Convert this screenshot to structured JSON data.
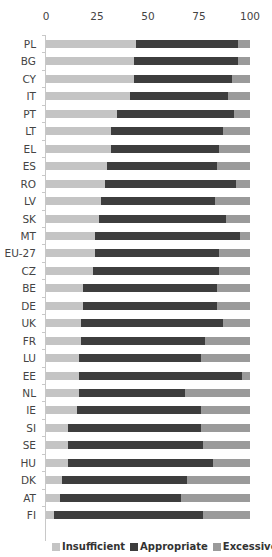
{
  "chart_data": {
    "type": "bar",
    "orientation": "horizontal",
    "stacked": true,
    "percent_stacked": true,
    "title": "",
    "xlabel": "",
    "ylabel": "",
    "xlim": [
      0,
      100
    ],
    "x_ticks": [
      "0",
      "25",
      "50",
      "75",
      "100"
    ],
    "x_axis_position": "top",
    "grid": false,
    "legend_position": "bottom",
    "categories": [
      "PL",
      "BG",
      "CY",
      "IT",
      "PT",
      "LT",
      "EL",
      "ES",
      "RO",
      "LV",
      "SK",
      "MT",
      "EU-27",
      "CZ",
      "BE",
      "DE",
      "UK",
      "FR",
      "LU",
      "EE",
      "NL",
      "IE",
      "SI",
      "SE",
      "HU",
      "DK",
      "AT",
      "FI"
    ],
    "series": [
      {
        "name": "Insufficient",
        "color": "#c4c4c4",
        "values": [
          44,
          43,
          43,
          41,
          35,
          32,
          32,
          30,
          29,
          27,
          26,
          24,
          24,
          23,
          18,
          18,
          17,
          17,
          16,
          16,
          16,
          15,
          11,
          11,
          11,
          8,
          7,
          4
        ]
      },
      {
        "name": "Appropriate",
        "color": "#3d3d3d",
        "values": [
          50,
          51,
          48,
          48,
          57,
          55,
          53,
          54,
          64,
          56,
          62,
          71,
          61,
          62,
          66,
          66,
          70,
          61,
          60,
          80,
          52,
          61,
          65,
          66,
          71,
          61,
          59,
          73
        ]
      },
      {
        "name": "Excessive",
        "color": "#9a9a9a",
        "values": [
          6,
          6,
          9,
          11,
          8,
          13,
          15,
          16,
          7,
          17,
          12,
          5,
          15,
          15,
          16,
          16,
          13,
          22,
          24,
          4,
          32,
          24,
          24,
          23,
          18,
          31,
          34,
          23
        ]
      }
    ]
  },
  "axis": {
    "ticks": [
      {
        "label": "0",
        "pos": 46
      },
      {
        "label": "25",
        "pos": 97
      },
      {
        "label": "50",
        "pos": 148
      },
      {
        "label": "75",
        "pos": 199
      },
      {
        "label": "100",
        "pos": 250
      }
    ]
  },
  "legend": {
    "items": [
      {
        "label": "Insufficient",
        "color": "#c4c4c4"
      },
      {
        "label": "Appropriate",
        "color": "#3d3d3d"
      },
      {
        "label": "Excessive",
        "color": "#9a9a9a"
      }
    ]
  }
}
